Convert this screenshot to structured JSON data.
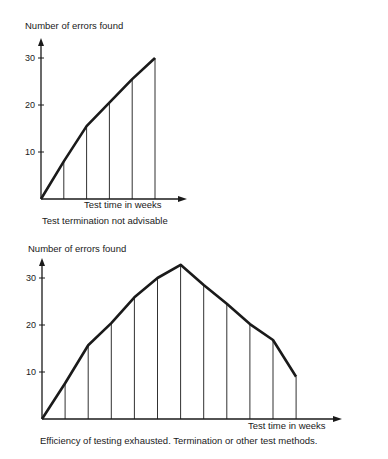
{
  "chart_data": [
    {
      "type": "line",
      "title": "",
      "caption": "Test termination not advisable",
      "xlabel": "Test time in weeks",
      "ylabel": "Number of errors found",
      "yticks": [
        10,
        20,
        30
      ],
      "ylim": [
        0,
        33
      ],
      "grid": false,
      "drop_lines": true,
      "x": [
        0,
        1,
        2,
        3,
        4,
        5
      ],
      "values": [
        0,
        8,
        15.5,
        20.5,
        25.5,
        30
      ],
      "color": "#1a1a1a"
    },
    {
      "type": "line",
      "title": "",
      "caption": "Efficiency of testing exhausted. Termination or other test methods.",
      "xlabel": "Test time in weeks",
      "ylabel": "Number of errors found",
      "yticks": [
        10,
        20,
        30
      ],
      "ylim": [
        0,
        35
      ],
      "grid": false,
      "drop_lines": true,
      "x": [
        0,
        1,
        2,
        3,
        4,
        5,
        6,
        7,
        8,
        9,
        10,
        11
      ],
      "values": [
        0,
        7.6,
        15.7,
        20.4,
        25.9,
        30,
        32.8,
        28.5,
        24.5,
        20.2,
        16.8,
        9
      ],
      "color": "#1a1a1a"
    }
  ],
  "layout": {
    "charts": [
      {
        "ox": 41,
        "oy": 199,
        "dx": 22.8,
        "ppu": 4.7,
        "yTop": 38,
        "xEnd": 187,
        "ylabelPos": [
          25,
          29
        ],
        "xlabelPos": [
          84,
          208
        ],
        "captionPos": [
          42,
          224
        ]
      },
      {
        "ox": 42,
        "oy": 419,
        "dx": 23.1,
        "ppu": 4.7,
        "yTop": 258,
        "xEnd": 342,
        "ylabelPos": [
          28,
          252
        ],
        "xlabelPos": [
          248,
          429
        ],
        "captionPos": [
          40,
          444
        ]
      }
    ]
  }
}
